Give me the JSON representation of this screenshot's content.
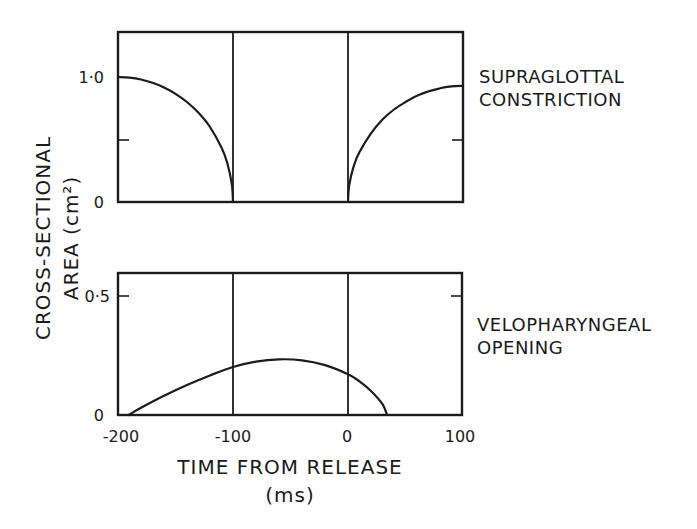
{
  "chart_data": {
    "type": "line",
    "ylabel_line1": "CROSS-SECTIONAL",
    "ylabel_line2": "AREA  (cm²)",
    "xlabel_line1": "TIME  FROM  RELEASE",
    "xlabel_line2": "(ms)",
    "xlim": [
      -200,
      100
    ],
    "x_ticks": [
      "-200",
      "-100",
      "0",
      "100"
    ],
    "vertical_reference_lines_ms": [
      -100,
      0
    ],
    "panels": [
      {
        "label_line1": "SUPRAGLOTTAL",
        "label_line2": "CONSTRICTION",
        "ylim": [
          0,
          1.37
        ],
        "y_ticks": [
          {
            "value": 0,
            "label": "0"
          },
          {
            "value": 0.5,
            "label": ""
          },
          {
            "value": 1.0,
            "label": "1·0"
          }
        ],
        "series": [
          {
            "name": "closing",
            "x": [
              -200,
              -190,
              -180,
              -170,
              -160,
              -150,
              -140,
              -130,
              -120,
              -110,
              -105,
              -101,
              -100
            ],
            "y": [
              1.0,
              0.995,
              0.98,
              0.954,
              0.917,
              0.866,
              0.8,
              0.714,
              0.6,
              0.436,
              0.312,
              0.14,
              0.0
            ]
          },
          {
            "name": "opening",
            "x": [
              0,
              1,
              5,
              10,
              20,
              30,
              40,
              50,
              60,
              70,
              80,
              90,
              100
            ],
            "y": [
              0.0,
              0.13,
              0.29,
              0.4,
              0.55,
              0.66,
              0.74,
              0.8,
              0.85,
              0.885,
              0.91,
              0.925,
              0.93
            ]
          }
        ]
      },
      {
        "label_line1": "VELOPHARYNGEAL",
        "label_line2": "OPENING",
        "ylim": [
          0,
          0.59
        ],
        "y_ticks": [
          {
            "value": 0,
            "label": "0"
          },
          {
            "value": 0.5,
            "label": "0·5"
          }
        ],
        "series": [
          {
            "name": "velopharyngeal",
            "x": [
              -191,
              -180,
              -160,
              -140,
              -120,
              -100,
              -80,
              -60,
              -40,
              -20,
              0,
              10,
              20,
              30,
              34
            ],
            "y": [
              0.0,
              0.03,
              0.08,
              0.125,
              0.165,
              0.2,
              0.222,
              0.232,
              0.228,
              0.208,
              0.17,
              0.14,
              0.1,
              0.045,
              0.0
            ]
          }
        ]
      }
    ]
  }
}
